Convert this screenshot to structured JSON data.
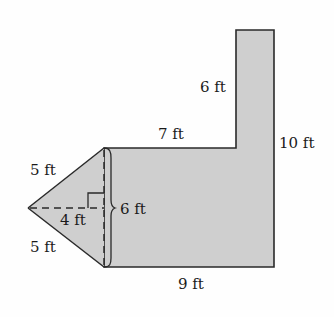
{
  "figure": {
    "type": "composite-area-figure",
    "colors": {
      "fill": "#cfcfcf",
      "stroke": "#2a2a2a",
      "background": "#fefefe"
    },
    "labels": {
      "triangle_upper_side": "5 ft",
      "triangle_lower_side": "5 ft",
      "triangle_height": "4 ft",
      "triangle_base": "6 ft",
      "top_step_width": "7 ft",
      "tall_part_height_above_step": "6 ft",
      "right_side_height": "10 ft",
      "bottom_width": "9 ft"
    },
    "components": [
      {
        "shape": "triangle",
        "base": "6 ft",
        "height": "4 ft",
        "sides": [
          "5 ft",
          "5 ft"
        ]
      },
      {
        "shape": "L-shaped polygon",
        "bottom": "9 ft",
        "right": "10 ft",
        "step": "7 ft",
        "upper_left": "6 ft"
      }
    ],
    "markers": {
      "right_angle": true,
      "brace_on_base": true
    }
  }
}
